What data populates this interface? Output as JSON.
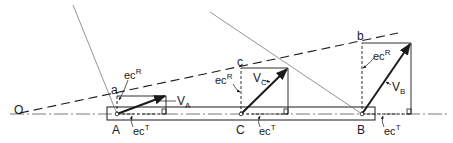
{
  "diagram": {
    "points": {
      "instant_center": "O",
      "link_points": [
        "A",
        "C",
        "B"
      ],
      "rotation_points": [
        "a",
        "c",
        "b"
      ]
    },
    "labels": {
      "O": "O",
      "A": "A",
      "C": "C",
      "B": "B",
      "a": "a",
      "c": "c",
      "b": "b",
      "VA_main": "V",
      "VA_sub": "A",
      "VC_main": "V",
      "VC_sub": "C",
      "VB_main": "V",
      "VB_sub": "B",
      "ecR_main": "ec",
      "ecR_sup": "R",
      "ecT_main": "ec",
      "ecT_sup": "T"
    },
    "colors": {
      "ink": "#1a1a1a",
      "thin": "#555555"
    }
  }
}
